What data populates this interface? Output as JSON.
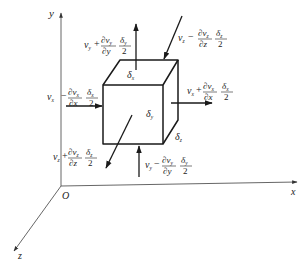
{
  "diagram": {
    "type": "control-volume velocity diagram",
    "axes": {
      "x_label": "x",
      "y_label": "y",
      "z_label": "z",
      "origin_label": "O"
    },
    "cube": {
      "face_labels": {
        "top": "δ",
        "top_sub": "x",
        "front": "δ",
        "front_sub": "y",
        "side": "δ",
        "side_sub": "z"
      }
    },
    "arrows": [
      {
        "id": "top",
        "direction": "up",
        "base": "v",
        "base_sub": "y",
        "sign": "+",
        "num": "∂v",
        "num_sub": "y",
        "den": "∂y",
        "delta": "δ",
        "delta_sub": "y",
        "two": "2"
      },
      {
        "id": "back",
        "direction": "into-top-back",
        "base": "v",
        "base_sub": "z",
        "sign": "−",
        "num": "∂v",
        "num_sub": "z",
        "den": "∂z",
        "delta": "δ",
        "delta_sub": "z",
        "two": "2"
      },
      {
        "id": "left",
        "direction": "right-into-left-face",
        "base": "v",
        "base_sub": "x",
        "sign": "−",
        "num": "∂v",
        "num_sub": "x",
        "den": "∂x",
        "delta": "δ",
        "delta_sub": "x",
        "two": "2"
      },
      {
        "id": "right",
        "direction": "right-out",
        "base": "v",
        "base_sub": "x",
        "sign": "+",
        "num": "∂v",
        "num_sub": "x",
        "den": "∂x",
        "delta": "δ",
        "delta_sub": "x",
        "two": "2"
      },
      {
        "id": "front",
        "direction": "out-front-down-left",
        "base": "v",
        "base_sub": "z",
        "sign": "+",
        "num": "∂v",
        "num_sub": "z",
        "den": "∂z",
        "delta": "δ",
        "delta_sub": "z",
        "two": "2"
      },
      {
        "id": "bottom",
        "direction": "up-into-bottom",
        "base": "v",
        "base_sub": "y",
        "sign": "−",
        "num": "∂v",
        "num_sub": "y",
        "den": "∂y",
        "delta": "δ",
        "delta_sub": "y",
        "two": "2"
      }
    ]
  }
}
